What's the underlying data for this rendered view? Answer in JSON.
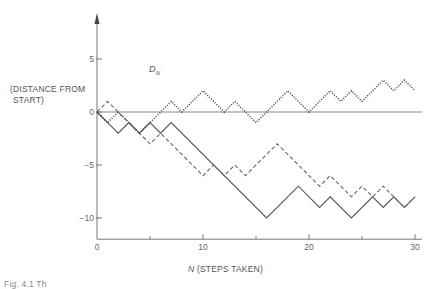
{
  "chart_data": {
    "type": "line",
    "title": "",
    "xlabel": "N (STEPS TAKEN)",
    "xlabel_var": "N",
    "xlabel_text": " (STEPS TAKEN)",
    "ylabel": "D_N (DISTANCE FROM START)",
    "ylabel_var": "D",
    "ylabel_sub": "N",
    "ylabel_line1": "(DISTANCE FROM",
    "ylabel_line2": "START)",
    "xlim": [
      0,
      30
    ],
    "ylim": [
      -12,
      8
    ],
    "x_ticks": [
      0,
      10,
      20,
      30
    ],
    "x_minor_ticks": [
      5,
      15,
      25
    ],
    "y_ticks": [
      5,
      0,
      -5,
      -10
    ],
    "y_tick_labels": [
      "5",
      "0",
      "−5",
      "−10"
    ],
    "x_tick_labels": [
      "0",
      "10",
      "20",
      "30"
    ],
    "grid": false,
    "legend": null,
    "reference_line": {
      "y": 0
    },
    "series": [
      {
        "name": "walk-solid",
        "style": "solid",
        "points": [
          [
            0,
            0
          ],
          [
            2,
            -2
          ],
          [
            3,
            -1
          ],
          [
            4,
            -2
          ],
          [
            5,
            -1
          ],
          [
            6,
            -2
          ],
          [
            7,
            -1
          ],
          [
            16,
            -10
          ],
          [
            19,
            -7
          ],
          [
            21,
            -9
          ],
          [
            22,
            -8
          ],
          [
            24,
            -10
          ],
          [
            26,
            -8
          ],
          [
            27,
            -9
          ],
          [
            28,
            -8
          ],
          [
            29,
            -9
          ],
          [
            30,
            -8
          ]
        ]
      },
      {
        "name": "walk-dashed",
        "style": "dashed",
        "points": [
          [
            0,
            0
          ],
          [
            1,
            1
          ],
          [
            5,
            -3
          ],
          [
            6,
            -2
          ],
          [
            10,
            -6
          ],
          [
            11,
            -5
          ],
          [
            12,
            -6
          ],
          [
            13,
            -5
          ],
          [
            14,
            -6
          ],
          [
            17,
            -3
          ],
          [
            21,
            -7
          ],
          [
            22,
            -6
          ],
          [
            24,
            -8
          ],
          [
            25,
            -7
          ],
          [
            26,
            -8
          ],
          [
            27,
            -7
          ],
          [
            29,
            -9
          ],
          [
            30,
            -8
          ]
        ]
      },
      {
        "name": "walk-dotted",
        "style": "dotted",
        "points": [
          [
            0,
            0
          ],
          [
            1,
            -1
          ],
          [
            2,
            0
          ],
          [
            4,
            -2
          ],
          [
            7,
            1
          ],
          [
            8,
            0
          ],
          [
            10,
            2
          ],
          [
            12,
            0
          ],
          [
            13,
            1
          ],
          [
            15,
            -1
          ],
          [
            18,
            2
          ],
          [
            20,
            0
          ],
          [
            22,
            2
          ],
          [
            23,
            1
          ],
          [
            24,
            2
          ],
          [
            25,
            1
          ],
          [
            27,
            3
          ],
          [
            28,
            2
          ],
          [
            29,
            3
          ],
          [
            30,
            2
          ]
        ]
      }
    ]
  },
  "caption": "Fig. 4.1  Th"
}
